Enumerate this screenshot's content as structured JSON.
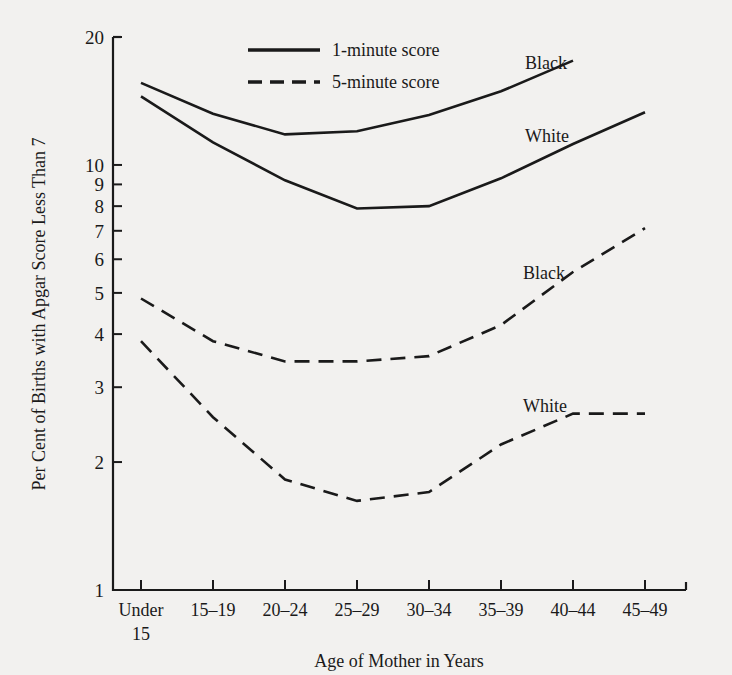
{
  "chart_data": {
    "type": "line",
    "title": "",
    "xlabel": "Age of Mother in Years",
    "ylabel": "Per Cent of Births with Apgar Score Less Than 7",
    "yscale": "log",
    "ylim": [
      1,
      20
    ],
    "ytick_labels": [
      "20",
      "10",
      "9",
      "8",
      "7",
      "6",
      "5",
      "4",
      "3",
      "2",
      "1"
    ],
    "ytick_values": [
      20,
      10,
      9,
      8,
      7,
      6,
      5,
      4,
      3,
      2,
      1
    ],
    "grid": false,
    "categories": [
      "Under 15",
      "15–19",
      "20–24",
      "25–29",
      "30–34",
      "35–39",
      "40–44",
      "45–49"
    ],
    "legend": {
      "position": "top-center",
      "entries": [
        {
          "label": "1-minute score",
          "style": "solid"
        },
        {
          "label": "5-minute score",
          "style": "dashed"
        }
      ]
    },
    "series": [
      {
        "name": "Black 1-minute score",
        "label": "Black",
        "style": "solid",
        "values": [
          15.6,
          13.2,
          11.8,
          12.0,
          13.1,
          14.9,
          17.6,
          null
        ]
      },
      {
        "name": "White 1-minute score",
        "label": "White",
        "style": "solid",
        "values": [
          14.5,
          11.3,
          9.2,
          7.9,
          8.0,
          9.3,
          11.2,
          13.3
        ]
      },
      {
        "name": "Black 5-minute score",
        "label": "Black",
        "style": "dashed",
        "values": [
          4.85,
          3.85,
          3.45,
          3.45,
          3.55,
          4.2,
          5.6,
          7.1
        ]
      },
      {
        "name": "White 5-minute score",
        "label": "White",
        "style": "dashed",
        "values": [
          3.85,
          2.55,
          1.82,
          1.62,
          1.7,
          2.2,
          2.6,
          2.6
        ]
      }
    ],
    "series_annotations": [
      {
        "text": "Black",
        "series": "Black 1-minute score"
      },
      {
        "text": "White",
        "series": "White 1-minute score"
      },
      {
        "text": "Black",
        "series": "Black 5-minute score"
      },
      {
        "text": "White",
        "series": "White 5-minute score"
      }
    ]
  }
}
